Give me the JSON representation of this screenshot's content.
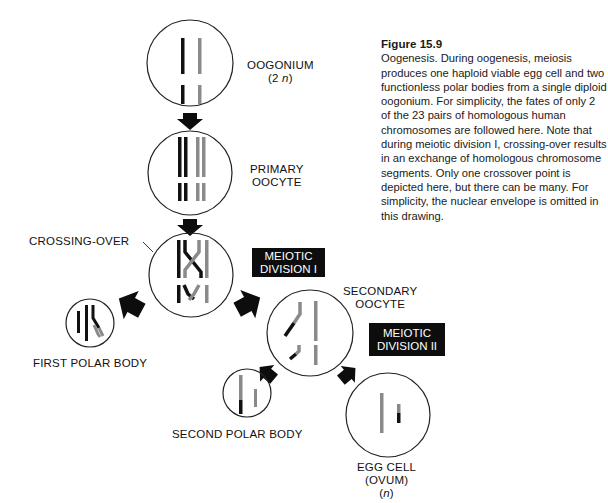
{
  "figure": {
    "title": "Figure 15.9",
    "caption": "Oogenesis. During oogenesis, meiosis produces one haploid viable egg cell and two functionless polar bodies from a single diploid oogonium. For simplicity, the fates of only 2 of the 23 pairs of homologous human chromosomes are followed here. Note that during meiotic division I, crossing-over results in an exchange of homologous chromosome segments. Only one crossover point is depicted here, but there can be many. For simplicity, the nuclear envelope is omitted in this drawing."
  },
  "stages": {
    "oogonium": {
      "name": "OOGONIUM",
      "ploidy_prefix": "(2 ",
      "ploidy_var": "n",
      "ploidy_suffix": ")"
    },
    "primary_oocyte": {
      "line1": "PRIMARY",
      "line2": "OOCYTE"
    },
    "crossing_over": {
      "label": "CROSSING-OVER"
    },
    "meiotic_division_1": {
      "line1": "MEIOTIC",
      "line2": "DIVISION I"
    },
    "first_polar_body": {
      "label": "FIRST POLAR BODY"
    },
    "secondary_oocyte": {
      "line1": "SECONDARY",
      "line2": "OOCYTE"
    },
    "meiotic_division_2": {
      "line1": "MEIOTIC",
      "line2": "DIVISION II"
    },
    "second_polar_body": {
      "label": "SECOND POLAR BODY"
    },
    "egg_cell": {
      "line1": "EGG CELL",
      "line2": "(OVUM)",
      "ploidy_prefix": "(",
      "ploidy_var": "n",
      "ploidy_suffix": ")"
    }
  },
  "colors": {
    "maternal_chromosome": "#111111",
    "paternal_chromosome": "#8a8a8a",
    "cell_outline": "#222222",
    "arrow": "#0d0d0d",
    "label_box_bg": "#0d0d0d",
    "label_box_text": "#ffffff"
  }
}
